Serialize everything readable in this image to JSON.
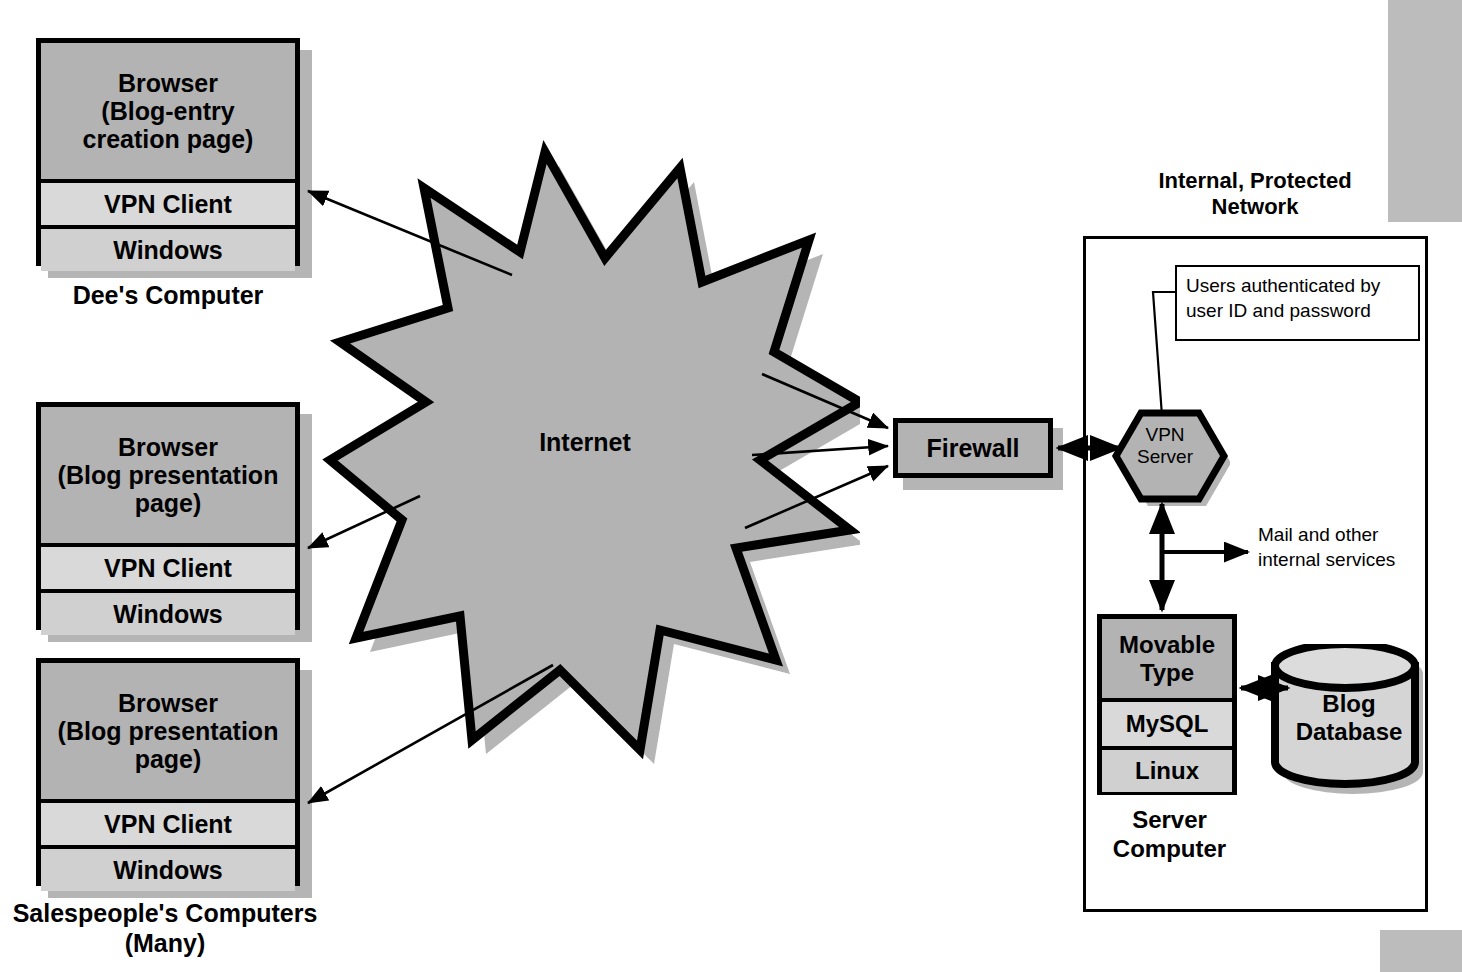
{
  "diagram": {
    "colors": {
      "fill_app": "#b3b3b3",
      "fill_mid": "#d9d9d9",
      "fill_os": "#d0d0d0",
      "fill_cloud": "#b3b3b3",
      "shadow": "#b5b5b5",
      "outline": "#000000",
      "page_edge": "#bcbcbc"
    }
  },
  "clients": [
    {
      "id": "dees-computer",
      "caption": "Dee's Computer",
      "rows": [
        "Browser\n(Blog-entry\ncreation page)",
        "VPN Client",
        "Windows"
      ]
    },
    {
      "id": "salesperson-computer-1",
      "caption": "",
      "rows": [
        "Browser\n(Blog presentation\npage)",
        "VPN Client",
        "Windows"
      ]
    },
    {
      "id": "salesperson-computer-2",
      "caption": "Salespeople's Computers\n(Many)",
      "rows": [
        "Browser\n(Blog presentation\npage)",
        "VPN Client",
        "Windows"
      ]
    }
  ],
  "internet": {
    "label": "Internet"
  },
  "firewall": {
    "label": "Firewall"
  },
  "network": {
    "title": "Internal, Protected\nNetwork",
    "callout": "Users authenticated by user ID and password",
    "vpn_server": "VPN\nServer",
    "mail_services": "Mail and other\ninternal services",
    "server_caption": "Server\nComputer",
    "server_stack": {
      "rows": [
        "Movable\nType",
        "MySQL",
        "Linux"
      ]
    },
    "database": "Blog\nDatabase"
  }
}
